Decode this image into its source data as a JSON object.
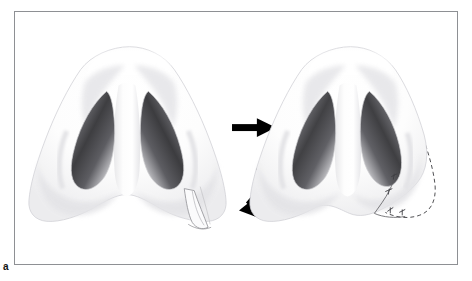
{
  "figure": {
    "label": "a",
    "caption_text": "",
    "panel_border_color": "#8e9094",
    "background_color": "#ffffff",
    "width": 472,
    "height": 281
  },
  "diagram": {
    "type": "medical-illustration",
    "procedure_label": "alar base reduction",
    "panels": [
      {
        "id": "preoperative",
        "name": "pre-operative-nose",
        "side": "left",
        "center_x": 130,
        "center_y": 145,
        "features": [
          "nasal-tip",
          "left-nostril",
          "right-nostril",
          "columella",
          "left-alar-lobule",
          "right-alar-lobule",
          "wedge-excision-marking"
        ]
      },
      {
        "id": "postoperative",
        "name": "post-operative-nose",
        "side": "right",
        "center_x": 352,
        "center_y": 145,
        "features": [
          "nasal-tip",
          "left-nostril",
          "right-nostril",
          "columella",
          "left-alar-lobule",
          "narrowed-right-alar-lobule",
          "suture-line",
          "dashed-preoperative-contour"
        ]
      }
    ],
    "arrows": [
      {
        "name": "straight-arrow",
        "direction": "right",
        "color": "#000000",
        "x": 232,
        "y": 128,
        "length": 42
      },
      {
        "name": "curved-arrow",
        "direction": "down-left",
        "color": "#000000",
        "x": 236,
        "y": 172
      }
    ],
    "annotations": {
      "wedge_excision": {
        "name": "wedge-excision-marking",
        "color": "#9a9a9a",
        "x": 182,
        "y": 205
      },
      "suture_marks": {
        "name": "suture-marks",
        "color": "#4a4a4a",
        "count": 4,
        "x": 390,
        "y": 212
      },
      "dashed_contour": {
        "name": "dashed-preoperative-contour",
        "color": "#555555",
        "dash_pattern": "4 3"
      }
    },
    "colors": {
      "skin_light": "#ffffff",
      "skin_shadow": "#e2e2e4",
      "skin_midtone": "#f2f2f3",
      "nostril_dark": "#3c3c3e",
      "nostril_mid": "#8d8d90",
      "outline": "#c9c9cc",
      "arrow": "#000000",
      "border": "#8e9094"
    }
  }
}
